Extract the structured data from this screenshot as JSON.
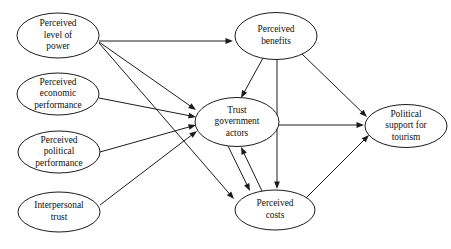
{
  "diagram": {
    "background_color": "#ffffff",
    "line_color": "#1c1c1c",
    "text_color": "#111111",
    "nodes": [
      {
        "id": "power",
        "name": "perceived-level-of-power",
        "lines": [
          "Perceived",
          "level of",
          "power"
        ],
        "cx": 58,
        "cy": 35.5,
        "rx": 41,
        "ry": 22.5
      },
      {
        "id": "economic",
        "name": "perceived-economic-performance",
        "lines": [
          "Perceived",
          "economic",
          "performance"
        ],
        "cx": 58,
        "cy": 94,
        "rx": 41,
        "ry": 21
      },
      {
        "id": "political",
        "name": "perceived-political-performance",
        "lines": [
          "Perceived",
          "political",
          "performance"
        ],
        "cx": 59,
        "cy": 152,
        "rx": 41,
        "ry": 21
      },
      {
        "id": "interpersonal",
        "name": "interpersonal-trust",
        "lines": [
          "Interpersonal",
          "trust"
        ],
        "cx": 59,
        "cy": 212,
        "rx": 41,
        "ry": 20
      },
      {
        "id": "benefits",
        "name": "perceived-benefits",
        "lines": [
          "Perceived",
          "benefits"
        ],
        "cx": 276,
        "cy": 36,
        "rx": 41,
        "ry": 23.5
      },
      {
        "id": "trust",
        "name": "trust-government-actors",
        "lines": [
          "Trust",
          "government",
          "actors"
        ],
        "cx": 237,
        "cy": 122,
        "rx": 42,
        "ry": 24.5
      },
      {
        "id": "costs",
        "name": "perceived-costs",
        "lines": [
          "Perceived",
          "costs"
        ],
        "cx": 275,
        "cy": 210,
        "rx": 40,
        "ry": 20
      },
      {
        "id": "support",
        "name": "political-support-for-tourism",
        "lines": [
          "Political",
          "support for",
          "tourism"
        ],
        "cx": 406,
        "cy": 126,
        "rx": 41,
        "ry": 21.5
      }
    ],
    "edges": [
      {
        "name": "edge-power-to-benefits",
        "from": "power",
        "to": "benefits",
        "x1": 99,
        "y1": 41,
        "x2": 233,
        "y2": 41
      },
      {
        "name": "edge-power-to-trust",
        "from": "power",
        "to": "trust",
        "x1": 99,
        "y1": 42,
        "x2": 196,
        "y2": 110
      },
      {
        "name": "edge-power-to-costs",
        "from": "power",
        "to": "costs",
        "x1": 99,
        "y1": 43,
        "x2": 234,
        "y2": 199
      },
      {
        "name": "edge-economic-to-trust",
        "from": "economic",
        "to": "trust",
        "x1": 99,
        "y1": 98,
        "x2": 196,
        "y2": 117
      },
      {
        "name": "edge-political-to-trust",
        "from": "political",
        "to": "trust",
        "x1": 100,
        "y1": 152,
        "x2": 196,
        "y2": 125
      },
      {
        "name": "edge-interpersonal-to-trust",
        "from": "interpersonal",
        "to": "trust",
        "x1": 100,
        "y1": 205,
        "x2": 197,
        "y2": 131
      },
      {
        "name": "edge-benefits-to-trust",
        "from": "benefits",
        "to": "trust",
        "x1": 263,
        "y1": 58,
        "x2": 241,
        "y2": 98
      },
      {
        "name": "edge-benefits-to-costs",
        "from": "benefits",
        "to": "costs",
        "x1": 277,
        "y1": 60,
        "x2": 277,
        "y2": 189
      },
      {
        "name": "edge-benefits-to-support",
        "from": "benefits",
        "to": "support",
        "x1": 302,
        "y1": 54,
        "x2": 367,
        "y2": 117
      },
      {
        "name": "edge-trust-to-support",
        "from": "trust",
        "to": "support",
        "x1": 279,
        "y1": 125,
        "x2": 364,
        "y2": 125
      },
      {
        "name": "edge-trust-to-costs",
        "from": "trust",
        "to": "costs",
        "x1": 228,
        "y1": 146,
        "x2": 250,
        "y2": 191
      },
      {
        "name": "edge-costs-to-trust",
        "from": "costs",
        "to": "trust",
        "x1": 262,
        "y1": 191,
        "x2": 241,
        "y2": 147
      },
      {
        "name": "edge-costs-to-support",
        "from": "costs",
        "to": "support",
        "x1": 305,
        "y1": 199,
        "x2": 369,
        "y2": 135
      }
    ]
  }
}
